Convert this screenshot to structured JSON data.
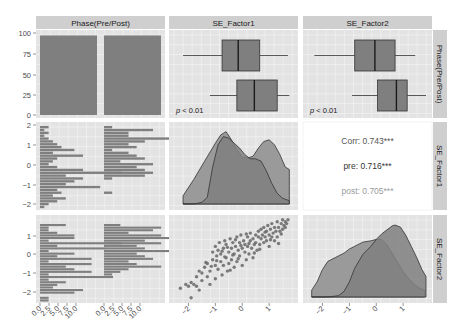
{
  "chart_data": {
    "type": "pairs-matrix",
    "title": "",
    "variables": [
      "Phase(Pre/Post)",
      "SE_Factor1",
      "SE_Factor2"
    ],
    "column_strips": [
      "Phase(Pre/Post)",
      "SE_Factor1",
      "SE_Factor2"
    ],
    "row_strips": [
      "Phase(Pre/Post)",
      "SE_Factor1",
      "SE_Factor2"
    ],
    "colors": {
      "panel_bg": "#e3e3e3",
      "grid": "#f5f5f5",
      "strip_bg": "#cfcfcf",
      "fill_dark": "#7f7f7f",
      "fill_light": "#9a9a9a",
      "line": "#333333",
      "point": "#6e6e6e",
      "corr_text": "#555555",
      "post_text": "#9a9a9a"
    },
    "axes": {
      "col1_x_ticks": [
        "0.0",
        "2.5",
        "5.0",
        "7.5",
        "10.0",
        "0.0",
        "2.5",
        "5.0",
        "7.5",
        "10.0"
      ],
      "col2_x_ticks": [
        "-2",
        "-1",
        "0",
        "1"
      ],
      "col3_x_ticks": [
        "-2",
        "-1",
        "0",
        "1"
      ],
      "row1_y_ticks": [
        "100",
        "75",
        "50",
        "25",
        "0"
      ],
      "row2_y_ticks": [
        "2",
        "1",
        "0",
        "-1",
        "-2"
      ],
      "row3_y_ticks": [
        "1",
        "0",
        "-1",
        "-2"
      ]
    },
    "panels": {
      "phase_bar": {
        "type": "bar",
        "categories": [
          "Pre",
          "Post"
        ],
        "values": [
          97,
          97
        ],
        "ylim": [
          0,
          100
        ]
      },
      "se1_box": {
        "type": "boxplot",
        "groups": [
          {
            "name": "Pre",
            "whisker_low": -2.2,
            "q1": -0.75,
            "median": -0.15,
            "q3": 0.65,
            "whisker_high": 1.7
          },
          {
            "name": "Post",
            "whisker_low": -1.2,
            "q1": -0.2,
            "median": 0.45,
            "q3": 1.3,
            "whisker_high": 1.75
          }
        ],
        "annotation": "p < 0.01"
      },
      "se2_box": {
        "type": "boxplot",
        "groups": [
          {
            "name": "Pre",
            "whisker_low": -2.3,
            "q1": -0.8,
            "median": -0.05,
            "q3": 0.7,
            "whisker_high": 1.45
          },
          {
            "name": "Post",
            "whisker_low": -0.9,
            "q1": 0.05,
            "median": 0.75,
            "q3": 1.15,
            "whisker_high": 1.85
          }
        ],
        "annotation": "p < 0.01"
      },
      "se1_density": {
        "type": "area",
        "series": [
          {
            "name": "Pre",
            "x": [
              -2.2,
              -1.8,
              -1.4,
              -1.0,
              -0.8,
              -0.6,
              -0.4,
              -0.2,
              0.0,
              0.2,
              0.4,
              0.6,
              0.8,
              1.0,
              1.2,
              1.4,
              1.6,
              1.75
            ],
            "y": [
              0.1,
              0.3,
              0.52,
              0.74,
              0.84,
              0.88,
              0.78,
              0.66,
              0.57,
              0.56,
              0.58,
              0.68,
              0.76,
              0.78,
              0.72,
              0.6,
              0.45,
              0.42
            ]
          },
          {
            "name": "Post",
            "x": [
              -2.2,
              -1.8,
              -1.5,
              -1.3,
              -1.1,
              -0.9,
              -0.7,
              -0.5,
              -0.3,
              -0.1,
              0.1,
              0.3,
              0.5,
              0.7,
              0.9,
              1.1,
              1.3,
              1.5,
              1.75
            ],
            "y": [
              0.0,
              0.0,
              0.02,
              0.08,
              0.45,
              0.72,
              0.82,
              0.8,
              0.74,
              0.68,
              0.6,
              0.55,
              0.55,
              0.52,
              0.4,
              0.25,
              0.13,
              0.07,
              0.04
            ]
          }
        ]
      },
      "se2_density": {
        "type": "area",
        "series": [
          {
            "name": "Pre",
            "x": [
              -2.4,
              -2.2,
              -2.0,
              -1.8,
              -1.5,
              -1.2,
              -1.0,
              -0.8,
              -0.5,
              -0.2,
              0.0,
              0.2,
              0.4,
              0.6,
              0.8,
              1.0,
              1.2,
              1.4,
              1.6,
              1.8
            ],
            "y": [
              0.1,
              0.22,
              0.4,
              0.52,
              0.58,
              0.64,
              0.7,
              0.74,
              0.8,
              0.82,
              0.84,
              0.84,
              0.76,
              0.63,
              0.5,
              0.37,
              0.27,
              0.19,
              0.13,
              0.1
            ]
          },
          {
            "name": "Post",
            "x": [
              -2.4,
              -1.8,
              -1.4,
              -1.2,
              -1.0,
              -0.8,
              -0.5,
              -0.2,
              0.0,
              0.2,
              0.4,
              0.6,
              0.7,
              0.9,
              1.1,
              1.3,
              1.5,
              1.7,
              1.85
            ],
            "y": [
              0.0,
              0.0,
              0.02,
              0.08,
              0.22,
              0.42,
              0.62,
              0.74,
              0.84,
              0.92,
              0.98,
              1.04,
              1.05,
              1.02,
              0.9,
              0.74,
              0.58,
              0.4,
              0.3
            ]
          }
        ]
      },
      "corr": {
        "lines": [
          {
            "label": "Corr: 0.743***",
            "shade": "corr"
          },
          {
            "label": "pre: 0.716***",
            "shade": "pre"
          },
          {
            "label": "post: 0.705***",
            "shade": "post"
          }
        ],
        "overall": 0.743,
        "pre": 0.716,
        "post": 0.705
      },
      "scatter": {
        "type": "scatter",
        "xlabel": "SE_Factor1",
        "ylabel": "SE_Factor2",
        "points": [
          [
            -2.3,
            -1.8
          ],
          [
            -2.1,
            -1.6
          ],
          [
            -2.0,
            -1.7
          ],
          [
            -1.9,
            -1.5
          ],
          [
            -1.9,
            -2.3
          ],
          [
            -1.8,
            -1.6
          ],
          [
            -1.7,
            -1.7
          ],
          [
            -1.7,
            -1.2
          ],
          [
            -1.6,
            -1.9
          ],
          [
            -1.5,
            -1.0
          ],
          [
            -1.5,
            -1.4
          ],
          [
            -1.4,
            -0.7
          ],
          [
            -1.3,
            -1.2
          ],
          [
            -1.3,
            -0.5
          ],
          [
            -1.2,
            -0.9
          ],
          [
            -1.2,
            -1.6
          ],
          [
            -1.1,
            -0.3
          ],
          [
            -1.1,
            0.1
          ],
          [
            -1.0,
            -0.6
          ],
          [
            -1.0,
            -1.3
          ],
          [
            -1.0,
            0.4
          ],
          [
            -0.95,
            -0.1
          ],
          [
            -0.9,
            0.2
          ],
          [
            -0.9,
            -0.8
          ],
          [
            -0.85,
            0.6
          ],
          [
            -0.8,
            -0.4
          ],
          [
            -0.8,
            0.0
          ],
          [
            -0.75,
            -1.1
          ],
          [
            -0.7,
            0.3
          ],
          [
            -0.7,
            -0.6
          ],
          [
            -0.65,
            0.7
          ],
          [
            -0.6,
            -0.2
          ],
          [
            -0.6,
            0.5
          ],
          [
            -0.55,
            -0.9
          ],
          [
            -0.5,
            0.1
          ],
          [
            -0.5,
            -0.5
          ],
          [
            -0.45,
            0.8
          ],
          [
            -0.4,
            0.3
          ],
          [
            -0.4,
            -0.3
          ],
          [
            -0.35,
            0.6
          ],
          [
            -0.3,
            -0.7
          ],
          [
            -0.3,
            0.0
          ],
          [
            -0.25,
            0.4
          ],
          [
            -0.2,
            0.9
          ],
          [
            -0.2,
            -0.4
          ],
          [
            -0.15,
            0.2
          ],
          [
            -0.1,
            0.6
          ],
          [
            -0.1,
            -0.1
          ],
          [
            -0.05,
            1.0
          ],
          [
            0.0,
            0.3
          ],
          [
            0.0,
            -0.6
          ],
          [
            0.05,
            0.7
          ],
          [
            0.1,
            0.1
          ],
          [
            0.1,
            0.5
          ],
          [
            0.15,
            -0.3
          ],
          [
            0.2,
            0.9
          ],
          [
            0.2,
            0.4
          ],
          [
            0.25,
            0.0
          ],
          [
            0.3,
            0.7
          ],
          [
            0.3,
            1.1
          ],
          [
            0.35,
            0.3
          ],
          [
            0.4,
            0.8
          ],
          [
            0.4,
            -0.2
          ],
          [
            0.45,
            0.5
          ],
          [
            0.5,
            1.0
          ],
          [
            0.5,
            0.6
          ],
          [
            0.55,
            0.2
          ],
          [
            0.6,
            0.9
          ],
          [
            0.6,
            1.2
          ],
          [
            0.65,
            0.5
          ],
          [
            0.7,
            0.8
          ],
          [
            0.7,
            1.3
          ],
          [
            0.75,
            1.0
          ],
          [
            0.8,
            0.6
          ],
          [
            0.8,
            1.4
          ],
          [
            0.85,
            0.9
          ],
          [
            0.9,
            1.2
          ],
          [
            0.9,
            0.7
          ],
          [
            0.95,
            1.5
          ],
          [
            1.0,
            1.0
          ],
          [
            1.0,
            0.4
          ],
          [
            1.05,
            1.3
          ],
          [
            1.1,
            0.9
          ],
          [
            1.1,
            1.6
          ],
          [
            1.15,
            1.1
          ],
          [
            1.2,
            0.7
          ],
          [
            1.2,
            1.4
          ],
          [
            1.25,
            1.2
          ],
          [
            1.3,
            1.7
          ],
          [
            1.3,
            0.9
          ],
          [
            1.35,
            1.4
          ],
          [
            1.4,
            1.2
          ],
          [
            1.45,
            1.6
          ],
          [
            1.5,
            1.3
          ],
          [
            1.5,
            1.8
          ],
          [
            1.55,
            1.5
          ],
          [
            1.6,
            1.4
          ],
          [
            1.6,
            1.7
          ],
          [
            1.65,
            1.6
          ],
          [
            1.7,
            1.8
          ],
          [
            -0.55,
            0.35
          ],
          [
            -0.35,
            -0.05
          ],
          [
            -0.15,
            -0.25
          ],
          [
            0.25,
            0.55
          ],
          [
            -0.75,
            0.15
          ],
          [
            -0.95,
            -0.35
          ],
          [
            0.65,
            0.25
          ],
          [
            1.05,
            0.75
          ],
          [
            -1.15,
            -0.65
          ],
          [
            -0.45,
            -0.85
          ],
          [
            0.15,
            1.05
          ],
          [
            -0.25,
            0.75
          ],
          [
            0.85,
            1.15
          ],
          [
            1.35,
            0.55
          ],
          [
            -1.35,
            -0.45
          ],
          [
            -0.65,
            -0.15
          ],
          [
            0.45,
            0.05
          ],
          [
            -0.05,
            0.45
          ],
          [
            -1.6,
            -0.9
          ],
          [
            1.45,
            1.05
          ]
        ]
      },
      "se1_hist": {
        "type": "bar-horizontal",
        "pre_counts": [
          1,
          0.5,
          1,
          0.5,
          1,
          1.5,
          2,
          2.5,
          4,
          1.5,
          5,
          2,
          1.5,
          1,
          2,
          5,
          9.5,
          3,
          5,
          4,
          3,
          7,
          2,
          2.5,
          1.5,
          3,
          2,
          1,
          0.5
        ],
        "post_counts": [
          1,
          6,
          3,
          3,
          8,
          5,
          3,
          4,
          1,
          3,
          4,
          5,
          2,
          6,
          4,
          5,
          6,
          5,
          1,
          0,
          0,
          0,
          0,
          1,
          0,
          0,
          0,
          0,
          0
        ]
      },
      "se2_hist": {
        "type": "bar-horizontal",
        "pre_counts": [
          3,
          1,
          1,
          2,
          4,
          4,
          1,
          9.5,
          2,
          7.5,
          1,
          4,
          2,
          6,
          1,
          6,
          3,
          4,
          6,
          1,
          8.5,
          1,
          3,
          2,
          1.5,
          5,
          4,
          0,
          1,
          1
        ],
        "post_counts": [
          2,
          7,
          6,
          3,
          7,
          8,
          5,
          7,
          4,
          5,
          8,
          4,
          5,
          6,
          3,
          4,
          7,
          3,
          2,
          1,
          0,
          0,
          0,
          0,
          0,
          0,
          0,
          0,
          0,
          0
        ]
      }
    }
  }
}
